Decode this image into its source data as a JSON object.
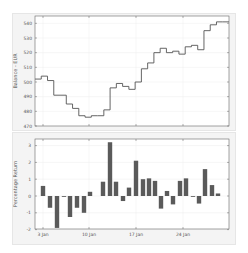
{
  "chart_data": [
    {
      "type": "line",
      "style": "step",
      "title": "",
      "xlabel": "",
      "ylabel": "Balance - EUR",
      "ylim": [
        470,
        545
      ],
      "yticks": [
        470,
        480,
        490,
        500,
        510,
        520,
        530,
        540
      ],
      "ytick_labels": [
        "470",
        "480",
        "490",
        "500",
        "510",
        "520",
        "530",
        "540"
      ],
      "x_day_range": [
        1,
        29
      ],
      "xticks_days": [
        3,
        10,
        17,
        24
      ],
      "grid": true,
      "line_color": "#555555",
      "values": [
        502,
        504,
        501,
        491,
        491,
        485,
        482,
        477,
        476,
        477,
        477,
        481,
        496,
        499,
        497,
        495,
        500,
        509,
        513,
        520,
        523,
        520,
        521,
        519,
        524,
        525,
        522,
        535,
        539,
        541,
        541
      ]
    },
    {
      "type": "bar",
      "title": "",
      "xlabel": "",
      "ylabel": "Percentage Return",
      "ylim": [
        -2,
        3.3
      ],
      "yticks": [
        -2,
        -1,
        0,
        1,
        2,
        3
      ],
      "ytick_labels": [
        "-2",
        "-1",
        "0",
        "1",
        "2",
        "3"
      ],
      "categories": [
        "3 Jan",
        "10 Jan",
        "17 Jan",
        "24 Jan"
      ],
      "xtick_labels": [
        "3 Jan",
        "10 Jan",
        "17 Jan",
        "24 Jan"
      ],
      "grid": true,
      "bar_color": "#5a5a5a",
      "bars": [
        {
          "x": 43,
          "v": 0.6
        },
        {
          "x": 50,
          "v": -0.7
        },
        {
          "x": 57,
          "v": -1.9
        },
        {
          "x": 64,
          "v": -0.05
        },
        {
          "x": 70,
          "v": -1.25
        },
        {
          "x": 77,
          "v": -0.7
        },
        {
          "x": 84,
          "v": -1.0
        },
        {
          "x": 90,
          "v": 0.25
        },
        {
          "x": 103,
          "v": 0.85
        },
        {
          "x": 110,
          "v": 3.2
        },
        {
          "x": 116,
          "v": 0.85
        },
        {
          "x": 123,
          "v": -0.3
        },
        {
          "x": 129,
          "v": 0.5
        },
        {
          "x": 136,
          "v": 2.1
        },
        {
          "x": 143,
          "v": 1.0
        },
        {
          "x": 149,
          "v": 1.05
        },
        {
          "x": 155,
          "v": 0.9
        },
        {
          "x": 161,
          "v": -0.75
        },
        {
          "x": 167,
          "v": 0.3
        },
        {
          "x": 173,
          "v": -0.5
        },
        {
          "x": 180,
          "v": 0.9
        },
        {
          "x": 186,
          "v": 1.05
        },
        {
          "x": 193,
          "v": -0.05
        },
        {
          "x": 199,
          "v": -0.45
        },
        {
          "x": 205,
          "v": 1.6
        },
        {
          "x": 212,
          "v": 0.65
        },
        {
          "x": 218,
          "v": 0.15
        }
      ]
    }
  ]
}
